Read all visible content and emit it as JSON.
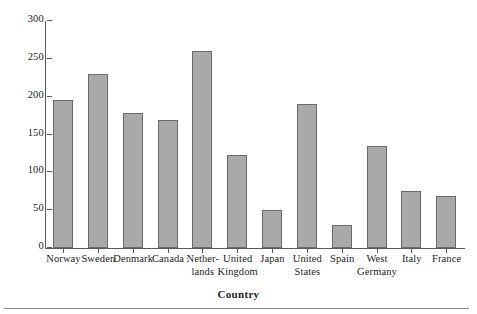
{
  "chart_data": {
    "type": "bar",
    "title": "",
    "xlabel": "Country",
    "ylabel": "",
    "categories": [
      "Norway",
      "Sweden",
      "Denmark",
      "Canada",
      "Nether-lands",
      "United Kingdom",
      "Japan",
      "United States",
      "Spain",
      "West Germany",
      "Italy",
      "France"
    ],
    "category_lines": [
      [
        "Norway"
      ],
      [
        "Sweden"
      ],
      [
        "Denmark"
      ],
      [
        "Canada"
      ],
      [
        "Nether-",
        "lands"
      ],
      [
        "United",
        "Kingdom"
      ],
      [
        "Japan"
      ],
      [
        "United",
        "States"
      ],
      [
        "Spain"
      ],
      [
        "West",
        "Germany"
      ],
      [
        "Italy"
      ],
      [
        "France"
      ]
    ],
    "values": [
      196,
      230,
      178,
      169,
      260,
      123,
      50,
      190,
      30,
      135,
      75,
      69
    ],
    "ylim": [
      0,
      300
    ],
    "yticks": [
      0,
      50,
      100,
      150,
      200,
      250,
      300
    ],
    "ytick_labels": [
      "0",
      "50",
      "100",
      "150",
      "200",
      "250",
      "300"
    ],
    "grid": false,
    "legend": "none",
    "bar_color": "#a9a9a9",
    "bar_border_color": "#6a6a6a",
    "axis_color": "#5a5a5a",
    "background": "#ffffff"
  }
}
